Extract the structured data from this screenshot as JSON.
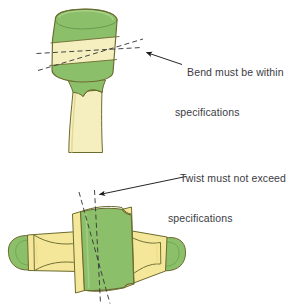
{
  "figure": {
    "background_color": "#ffffff"
  },
  "annotations": {
    "bend": {
      "line1": "Bend must be within",
      "line2": "specifications",
      "text": "Bend must be within specifications",
      "text_color": "#3b3b3f",
      "arrow_color": "#1a1a1a",
      "arrow_from": [
        182,
        64
      ],
      "arrow_to": [
        141,
        52
      ]
    },
    "twist": {
      "line1": "Twist must not exceed",
      "line2": "specifications",
      "text": "Twist must not exceed specifications",
      "text_color": "#3b3b3f",
      "arrow_color": "#1a1a1a",
      "arrow_from": [
        186,
        176
      ],
      "arrow_to": [
        95,
        195
      ]
    }
  },
  "top_figure": {
    "name": "bent-component-side-view",
    "description": "Cylindrical head on a tapered stem, shown tilted, with two dashed reference axes crossing to indicate bend angle",
    "colors": {
      "green_fill": "#8cbf6a",
      "green_dark": "#6fa94f",
      "cream_fill": "#f5efc0",
      "cream_shade": "#efe6a8",
      "outline": "#6b6b2f",
      "dash_color": "#3a3a3a"
    },
    "reference_axes": {
      "axis_nominal_label": "horizontal reference axis",
      "axis_actual_label": "tilted component axis",
      "bend_indicated": true
    }
  },
  "bottom_figure": {
    "name": "twisted-component-plan-view",
    "description": "Symmetric component with rounded green end caps, yellow arms and a central green block, with two dashed reference axes diverging to indicate twist angle",
    "colors": {
      "green_fill": "#8cbf6a",
      "green_dark": "#6fa94f",
      "yellow_fill": "#f5e79a",
      "yellow_shade": "#eedd86",
      "outline": "#6b6b2f",
      "dash_color": "#3a3a3a"
    },
    "reference_axes": {
      "axis_nominal_label": "vertical reference axis",
      "axis_actual_label": "twisted component axis",
      "twist_indicated": true
    }
  }
}
